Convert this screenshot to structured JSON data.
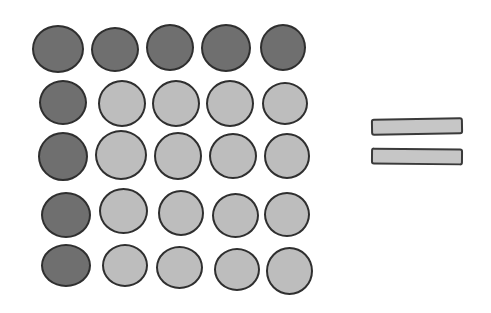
{
  "diagram": {
    "title": "",
    "grid": {
      "rows": 5,
      "cols": 5,
      "colors": {
        "dark": "#6f6f6f",
        "light": "#bdbdbd",
        "outline": "#2f2f2f"
      },
      "cells": [
        {
          "x": 32,
          "y": 25,
          "w": 52,
          "h": 48,
          "tone": "dark"
        },
        {
          "x": 91,
          "y": 27,
          "w": 48,
          "h": 45,
          "tone": "dark"
        },
        {
          "x": 146,
          "y": 24,
          "w": 48,
          "h": 47,
          "tone": "dark"
        },
        {
          "x": 201,
          "y": 24,
          "w": 50,
          "h": 48,
          "tone": "dark"
        },
        {
          "x": 260,
          "y": 24,
          "w": 46,
          "h": 47,
          "tone": "dark"
        },
        {
          "x": 39,
          "y": 80,
          "w": 48,
          "h": 45,
          "tone": "dark"
        },
        {
          "x": 98,
          "y": 80,
          "w": 48,
          "h": 47,
          "tone": "light"
        },
        {
          "x": 152,
          "y": 80,
          "w": 48,
          "h": 47,
          "tone": "light"
        },
        {
          "x": 206,
          "y": 80,
          "w": 48,
          "h": 47,
          "tone": "light"
        },
        {
          "x": 262,
          "y": 82,
          "w": 46,
          "h": 43,
          "tone": "light"
        },
        {
          "x": 38,
          "y": 132,
          "w": 50,
          "h": 49,
          "tone": "dark"
        },
        {
          "x": 95,
          "y": 130,
          "w": 52,
          "h": 50,
          "tone": "light"
        },
        {
          "x": 154,
          "y": 132,
          "w": 48,
          "h": 48,
          "tone": "light"
        },
        {
          "x": 209,
          "y": 133,
          "w": 48,
          "h": 46,
          "tone": "light"
        },
        {
          "x": 264,
          "y": 133,
          "w": 46,
          "h": 46,
          "tone": "light"
        },
        {
          "x": 41,
          "y": 192,
          "w": 50,
          "h": 46,
          "tone": "dark"
        },
        {
          "x": 99,
          "y": 188,
          "w": 49,
          "h": 46,
          "tone": "light"
        },
        {
          "x": 158,
          "y": 190,
          "w": 46,
          "h": 46,
          "tone": "light"
        },
        {
          "x": 212,
          "y": 193,
          "w": 47,
          "h": 45,
          "tone": "light"
        },
        {
          "x": 264,
          "y": 192,
          "w": 46,
          "h": 45,
          "tone": "light"
        },
        {
          "x": 41,
          "y": 244,
          "w": 50,
          "h": 43,
          "tone": "dark"
        },
        {
          "x": 102,
          "y": 244,
          "w": 46,
          "h": 43,
          "tone": "light"
        },
        {
          "x": 156,
          "y": 246,
          "w": 47,
          "h": 43,
          "tone": "light"
        },
        {
          "x": 214,
          "y": 248,
          "w": 46,
          "h": 43,
          "tone": "light"
        },
        {
          "x": 266,
          "y": 247,
          "w": 47,
          "h": 48,
          "tone": "light"
        }
      ]
    },
    "equals_sign": {
      "color": "#c6c6c6",
      "bars": [
        {
          "x": 371,
          "y": 118,
          "w": 92,
          "h": 17
        },
        {
          "x": 371,
          "y": 148,
          "w": 92,
          "h": 17
        }
      ]
    }
  }
}
